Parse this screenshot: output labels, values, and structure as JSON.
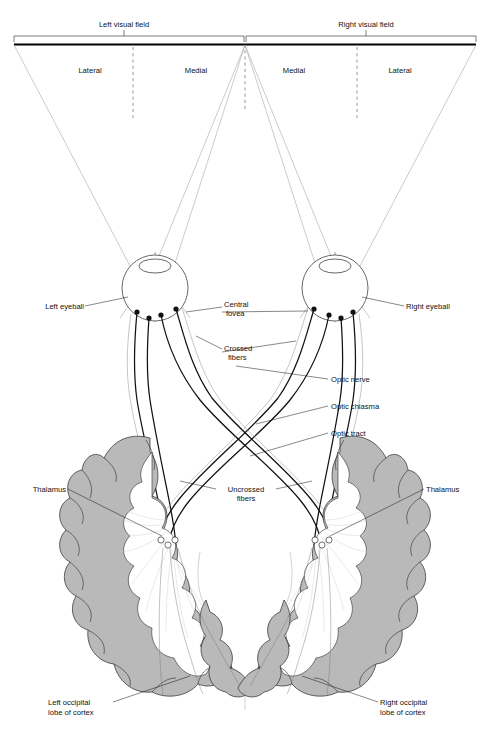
{
  "figure": {
    "type": "anatomical-diagram"
  },
  "field_bar": {
    "left_field_label": "Left visual field",
    "right_field_label": "Right visual field",
    "quadrants": {
      "left_lateral": "Lateral",
      "left_medial": "Medial",
      "right_medial": "Medial",
      "right_lateral": "Lateral"
    }
  },
  "labels": {
    "left_eyeball": "Left eyeball",
    "right_eyeball": "Right eyeball",
    "central_fovea_line1": "Central",
    "central_fovea_line2": "fovea",
    "crossed_fibers_line1": "Crossed",
    "crossed_fibers_line2": "fibers",
    "uncrossed_fibers_line1": "Uncrossed",
    "uncrossed_fibers_line2": "fibers",
    "optic_nerve": "Optic nerve",
    "optic_chiasma": "Optic chiasma",
    "optic_tract": "Optic tract",
    "thalamus_left": "Thalamus",
    "thalamus_right": "Thalamus",
    "left_occipital_line1": "Left occipital",
    "left_occipital_line2": "lobe of cortex",
    "right_occipital_line1": "Right occipital",
    "right_occipital_line2": "lobe of cortex"
  },
  "colors": {
    "cortex_gray": "#b9b9b9",
    "outline": "#2b2b2b",
    "fiber": "#111111",
    "cone_ray": "#9a9a9a",
    "background": "#ffffff"
  }
}
